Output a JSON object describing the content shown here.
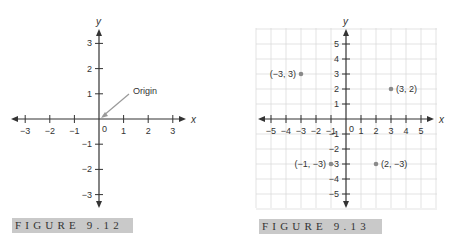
{
  "chart_data": [
    {
      "type": "scatter",
      "title": "",
      "caption": "FIGURE 9.12",
      "xlabel": "x",
      "ylabel": "y",
      "xlim": [
        -3,
        3
      ],
      "ylim": [
        -3,
        3
      ],
      "grid": false,
      "x_ticks": [
        -3,
        -2,
        -1,
        0,
        1,
        2,
        3
      ],
      "y_ticks": [
        -3,
        -2,
        -1,
        1,
        2,
        3
      ],
      "annotations": [
        {
          "text": "Origin",
          "points_to": [
            0,
            0
          ]
        }
      ],
      "points": []
    },
    {
      "type": "scatter",
      "title": "",
      "caption": "FIGURE 9.13",
      "xlabel": "x",
      "ylabel": "y",
      "xlim": [
        -5,
        5
      ],
      "ylim": [
        -5,
        5
      ],
      "grid": true,
      "x_ticks": [
        -5,
        -4,
        -3,
        -2,
        -1,
        0,
        1,
        2,
        3,
        4,
        5
      ],
      "y_ticks": [
        -5,
        -4,
        -3,
        -2,
        -1,
        1,
        2,
        3,
        4,
        5
      ],
      "points": [
        {
          "x": -3,
          "y": 3,
          "label": "(−3, 3)"
        },
        {
          "x": 3,
          "y": 2,
          "label": "(3, 2)"
        },
        {
          "x": -1,
          "y": -3,
          "label": "(−1, −3)"
        },
        {
          "x": 2,
          "y": -3,
          "label": "(2, −3)"
        }
      ]
    }
  ],
  "colors": {
    "axis": "#333333",
    "grid": "#dcdcdc",
    "point": "#8a8a8a",
    "annotation_arrow": "#9a9a9a",
    "caption_bg": "#c9c9c9"
  }
}
